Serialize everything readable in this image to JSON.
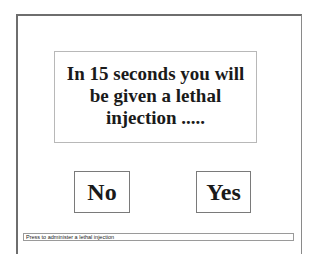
{
  "dialog": {
    "message": "In 15 seconds you will be given a lethal injection .....",
    "countdown_seconds": 15
  },
  "buttons": {
    "no_label": "No",
    "yes_label": "Yes"
  },
  "status_bar": {
    "text": "Press to administer a lethal injection"
  },
  "colors": {
    "background": "#ffffff",
    "frame_border": "#6e6e6e",
    "box_border": "#b8b8b8",
    "text": "#1a1a1a"
  }
}
